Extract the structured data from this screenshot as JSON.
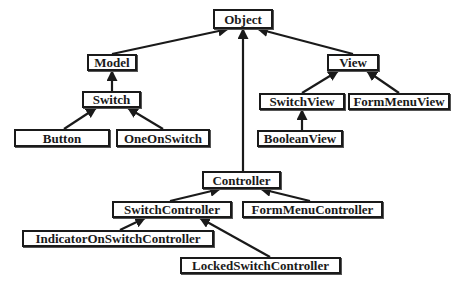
{
  "diagram": {
    "type": "class-inheritance-hierarchy",
    "colors": {
      "line": "#1a1a1a",
      "box_border": "#1a1a1a",
      "background": "#ffffff"
    },
    "nodes": [
      {
        "id": "object",
        "label": "Object",
        "x": 213,
        "y": 9,
        "w": 60,
        "h": 20
      },
      {
        "id": "model",
        "label": "Model",
        "x": 87,
        "y": 54,
        "w": 50,
        "h": 17
      },
      {
        "id": "switch",
        "label": "Switch",
        "x": 82,
        "y": 91,
        "w": 59,
        "h": 17
      },
      {
        "id": "button",
        "label": "Button",
        "x": 14,
        "y": 129,
        "w": 96,
        "h": 18
      },
      {
        "id": "oneonswitch",
        "label": "OneOnSwitch",
        "x": 116,
        "y": 129,
        "w": 94,
        "h": 18
      },
      {
        "id": "view",
        "label": "View",
        "x": 327,
        "y": 54,
        "w": 52,
        "h": 17
      },
      {
        "id": "switchview",
        "label": "SwitchView",
        "x": 259,
        "y": 93,
        "w": 86,
        "h": 17
      },
      {
        "id": "formmenuview",
        "label": "FormMenuView",
        "x": 348,
        "y": 93,
        "w": 102,
        "h": 17
      },
      {
        "id": "booleanview",
        "label": "BooleanView",
        "x": 257,
        "y": 130,
        "w": 86,
        "h": 17
      },
      {
        "id": "controller",
        "label": "Controller",
        "x": 202,
        "y": 171,
        "w": 79,
        "h": 18
      },
      {
        "id": "switchcontroller",
        "label": "SwitchController",
        "x": 112,
        "y": 201,
        "w": 120,
        "h": 17
      },
      {
        "id": "formmenucontroller",
        "label": "FormMenuController",
        "x": 242,
        "y": 201,
        "w": 141,
        "h": 17
      },
      {
        "id": "indicatoronswitchcontroller",
        "label": "IndicatorOnSwitchController",
        "x": 22,
        "y": 230,
        "w": 192,
        "h": 17
      },
      {
        "id": "lockedswitchcontroller",
        "label": "LockedSwitchController",
        "x": 180,
        "y": 257,
        "w": 161,
        "h": 17
      }
    ],
    "edges": [
      {
        "from": "model",
        "to": "object",
        "x1": 112,
        "y1": 54,
        "x2": 228,
        "y2": 29
      },
      {
        "from": "view",
        "to": "object",
        "x1": 353,
        "y1": 54,
        "x2": 258,
        "y2": 29
      },
      {
        "from": "controller",
        "to": "object",
        "x1": 243,
        "y1": 171,
        "x2": 243,
        "y2": 29
      },
      {
        "from": "switch",
        "to": "model",
        "x1": 112,
        "y1": 91,
        "x2": 112,
        "y2": 71
      },
      {
        "from": "button",
        "to": "switch",
        "x1": 64,
        "y1": 129,
        "x2": 96,
        "y2": 108
      },
      {
        "from": "oneonswitch",
        "to": "switch",
        "x1": 163,
        "y1": 129,
        "x2": 128,
        "y2": 108
      },
      {
        "from": "switchview",
        "to": "view",
        "x1": 302,
        "y1": 93,
        "x2": 338,
        "y2": 71
      },
      {
        "from": "formmenuview",
        "to": "view",
        "x1": 399,
        "y1": 93,
        "x2": 367,
        "y2": 71
      },
      {
        "from": "booleanview",
        "to": "switchview",
        "x1": 302,
        "y1": 130,
        "x2": 302,
        "y2": 110
      },
      {
        "from": "switchcontroller",
        "to": "controller",
        "x1": 170,
        "y1": 201,
        "x2": 220,
        "y2": 189
      },
      {
        "from": "formmenucontroller",
        "to": "controller",
        "x1": 310,
        "y1": 201,
        "x2": 261,
        "y2": 189
      },
      {
        "from": "indicatoronswitchcontroller",
        "to": "switchcontroller",
        "x1": 120,
        "y1": 230,
        "x2": 145,
        "y2": 218
      },
      {
        "from": "lockedswitchcontroller",
        "to": "switchcontroller",
        "x1": 270,
        "y1": 257,
        "x2": 200,
        "y2": 218
      }
    ]
  }
}
